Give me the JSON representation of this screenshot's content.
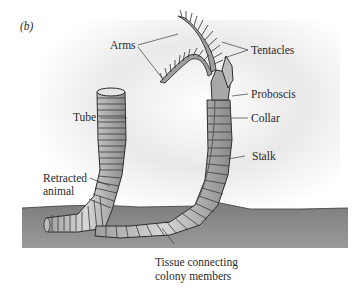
{
  "figure": {
    "panel_label": "(b)",
    "labels": {
      "arms": "Arms",
      "tentacles": "Tentacles",
      "tube": "Tube",
      "proboscis": "Proboscis",
      "collar": "Collar",
      "retracted_line1": "Retracted",
      "retracted_line2": "animal",
      "stalk": "Stalk",
      "tissue_line1": "Tissue connecting",
      "tissue_line2": "colony members"
    }
  }
}
